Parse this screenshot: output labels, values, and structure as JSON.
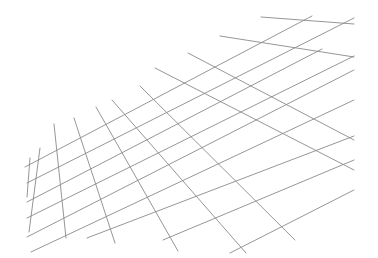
{
  "figure": {
    "type": "perspective-grid",
    "background": "#ffffff",
    "line_color": "#8a8a8a",
    "rising_lines": [
      [
        25,
        167,
        312,
        16
      ],
      [
        27,
        183,
        354,
        18
      ],
      [
        27,
        202,
        322,
        49
      ],
      [
        27,
        218,
        354,
        56
      ],
      [
        27,
        237,
        354,
        70
      ],
      [
        31,
        252,
        354,
        100
      ],
      [
        87,
        238,
        354,
        136
      ],
      [
        163,
        240,
        354,
        160
      ],
      [
        230,
        253,
        354,
        190
      ]
    ],
    "cross_lines": [
      [
        261,
        17,
        354,
        24
      ],
      [
        220,
        36,
        354,
        57
      ],
      [
        188,
        53,
        354,
        140
      ],
      [
        155,
        68,
        354,
        170
      ],
      [
        140,
        86,
        295,
        240
      ],
      [
        112,
        100,
        246,
        253
      ],
      [
        96,
        107,
        178,
        251
      ],
      [
        74,
        118,
        115,
        243
      ],
      [
        54,
        124,
        66,
        238
      ],
      [
        40,
        148,
        29,
        232
      ],
      [
        30,
        158,
        27,
        197
      ]
    ]
  }
}
